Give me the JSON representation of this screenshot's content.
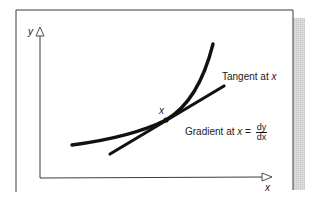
{
  "diagram": {
    "title": "",
    "axes": {
      "y_label": "y",
      "x_label": "x"
    },
    "curve": {
      "description": "increasing convex curve y = f(x)",
      "color": "#111111"
    },
    "tangent": {
      "label_prefix": "Tangent at ",
      "label_var": "x",
      "color": "#111111"
    },
    "point": {
      "label": "x"
    },
    "gradient": {
      "label_prefix": "Gradient at ",
      "label_var": "x",
      "equals": " = ",
      "numerator": "dy",
      "denominator": "dx"
    },
    "colors": {
      "frame": "#3a3a3a",
      "shadow": "#d4d4d4",
      "ink": "#111111",
      "background": "#ffffff"
    }
  }
}
